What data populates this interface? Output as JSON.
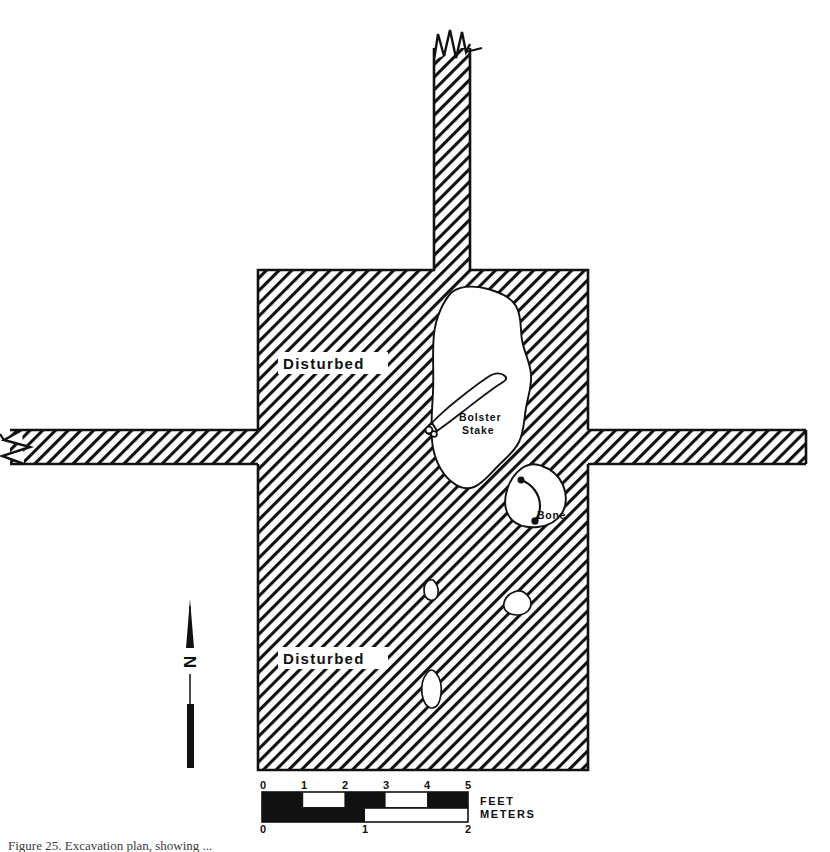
{
  "figure": {
    "caption": "Figure 25. Excavation plan, showing ...",
    "background_color": "#ffffff",
    "ink_color": "#111111"
  },
  "plan": {
    "title": "Archaeological excavation trench plan",
    "hatch_description": "45-degree diagonal line hatching indicating excavated trench fill",
    "hatch_color": "#111111",
    "outline_color": "#111111",
    "unexcavated_fill": "#ffffff"
  },
  "area_labels": [
    {
      "text": "Disturbed",
      "x": 283,
      "y": 366
    },
    {
      "text": "Disturbed",
      "x": 283,
      "y": 661
    }
  ],
  "feature_labels": [
    {
      "text": "Bolster",
      "x": 459,
      "y": 417
    },
    {
      "text": "Stake",
      "x": 462,
      "y": 430
    },
    {
      "text": "Bone",
      "x": 537,
      "y": 516
    }
  ],
  "north_arrow": {
    "label": "N",
    "x": 190,
    "tip_y": 600,
    "tail_y": 768
  },
  "scale_bar": {
    "feet": {
      "unit_label": "FEET",
      "ticks": [
        "0",
        "1",
        "2",
        "3",
        "4",
        "5"
      ],
      "max": 5
    },
    "meters": {
      "unit_label": "METERS",
      "ticks": [
        "0",
        "1",
        "2"
      ],
      "max": 2
    },
    "feet_bar_left": 262,
    "feet_bar_right": 468,
    "meters_bar_left": 262,
    "meters_bar_right": 468,
    "unit_text_x": 480
  },
  "break_symbols": [
    {
      "name": "trench-break-top",
      "x": 440,
      "y": 35,
      "orientation": "vertical"
    },
    {
      "name": "trench-break-left",
      "x": 10,
      "y": 445,
      "orientation": "horizontal"
    }
  ]
}
